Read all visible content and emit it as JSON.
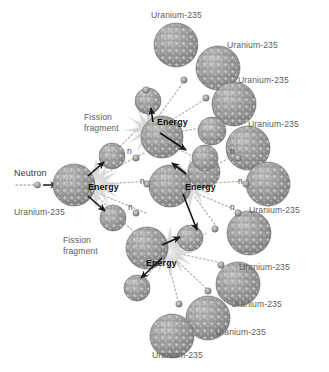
{
  "figure": {
    "type": "diagram",
    "background_color": "#ffffff",
    "nucleus_color": "#8d8d8d",
    "label_color": "#5d5d5d",
    "emphasis_color": "#111111"
  },
  "labels": {
    "neutron": "Neutron",
    "energy": "Energy",
    "fission_fragment": "Fission\nfragment",
    "uranium": "Uranium-235",
    "neutron_short": "n"
  },
  "annotations": [
    {
      "id": "neutron-in",
      "text": "Neutron",
      "x": 14,
      "y": 172,
      "style": "neu"
    },
    {
      "id": "uranium-left",
      "text": "Uranium-235",
      "x": 14,
      "y": 212,
      "style": "plain"
    },
    {
      "id": "fission-frag-1",
      "text": "Fission",
      "x": 84,
      "y": 116,
      "style": "plain"
    },
    {
      "id": "fission-frag-1b",
      "text": "fragment",
      "x": 84,
      "y": 127,
      "style": "plain"
    },
    {
      "id": "fission-frag-2",
      "text": "Fission",
      "x": 63,
      "y": 239,
      "style": "plain"
    },
    {
      "id": "fission-frag-2b",
      "text": "fragment",
      "x": 63,
      "y": 250,
      "style": "plain"
    },
    {
      "id": "energy-top",
      "text": "Energy",
      "x": 157,
      "y": 121,
      "style": "dark"
    },
    {
      "id": "energy-mid-left",
      "text": "Energy",
      "x": 88,
      "y": 186,
      "style": "dark"
    },
    {
      "id": "energy-mid-right",
      "text": "Energy",
      "x": 185,
      "y": 186,
      "style": "dark"
    },
    {
      "id": "energy-bottom",
      "text": "Energy",
      "x": 146,
      "y": 262,
      "style": "dark"
    },
    {
      "id": "uranium-top-1",
      "text": "Uranium-235",
      "x": 151,
      "y": 14,
      "style": "plain"
    },
    {
      "id": "uranium-top-2",
      "text": "Uranium-235",
      "x": 227,
      "y": 44,
      "style": "plain"
    },
    {
      "id": "uranium-top-3",
      "text": "Uranium-235",
      "x": 238,
      "y": 79,
      "style": "plain"
    },
    {
      "id": "uranium-top-4",
      "text": "Uranium-235",
      "x": 248,
      "y": 123,
      "style": "plain"
    },
    {
      "id": "uranium-right-1",
      "text": "Uranium-235",
      "x": 249,
      "y": 209,
      "style": "plain"
    },
    {
      "id": "uranium-right-2",
      "text": "Uranium-235",
      "x": 239,
      "y": 266,
      "style": "plain"
    },
    {
      "id": "uranium-right-3",
      "text": "Uranium-235",
      "x": 231,
      "y": 303,
      "style": "plain"
    },
    {
      "id": "uranium-bot-1",
      "text": "Uranium-235",
      "x": 215,
      "y": 331,
      "style": "plain"
    },
    {
      "id": "uranium-bot-2",
      "text": "Uranium-235",
      "x": 152,
      "y": 354,
      "style": "plain"
    },
    {
      "id": "n-1",
      "text": "n",
      "x": 127,
      "y": 150,
      "style": "nlet"
    },
    {
      "id": "n-2",
      "text": "n",
      "x": 140,
      "y": 180,
      "style": "nlet"
    },
    {
      "id": "n-3",
      "text": "n",
      "x": 128,
      "y": 206,
      "style": "nlet"
    },
    {
      "id": "n-4",
      "text": "n",
      "x": 230,
      "y": 150,
      "style": "nlet"
    },
    {
      "id": "n-5",
      "text": "n",
      "x": 238,
      "y": 180,
      "style": "nlet"
    },
    {
      "id": "n-6",
      "text": "n",
      "x": 230,
      "y": 206,
      "style": "nlet"
    }
  ],
  "nuclei": [
    {
      "id": "u-target-1",
      "role": "target",
      "cx": 74,
      "cy": 185,
      "r": 21
    },
    {
      "id": "u-target-2",
      "role": "target",
      "cx": 162,
      "cy": 137,
      "r": 21
    },
    {
      "id": "u-target-3",
      "role": "target",
      "cx": 170,
      "cy": 186,
      "r": 21
    },
    {
      "id": "u-target-4",
      "role": "target",
      "cx": 147,
      "cy": 248,
      "r": 21
    },
    {
      "id": "frag-1",
      "role": "fragment",
      "cx": 112,
      "cy": 156,
      "r": 13
    },
    {
      "id": "frag-2",
      "role": "fragment",
      "cx": 113,
      "cy": 218,
      "r": 13
    },
    {
      "id": "frag-3",
      "role": "fragment",
      "cx": 148,
      "cy": 101,
      "r": 13
    },
    {
      "id": "frag-4",
      "role": "fragment",
      "cx": 205,
      "cy": 158,
      "r": 13
    },
    {
      "id": "frag-5",
      "role": "fragment",
      "cx": 190,
      "cy": 238,
      "r": 13
    },
    {
      "id": "frag-6",
      "role": "fragment",
      "cx": 137,
      "cy": 288,
      "r": 13
    },
    {
      "id": "u-free-1",
      "role": "free",
      "cx": 176,
      "cy": 45,
      "r": 22
    },
    {
      "id": "u-free-2",
      "role": "free",
      "cx": 218,
      "cy": 68,
      "r": 22
    },
    {
      "id": "u-free-3",
      "role": "free",
      "cx": 234,
      "cy": 104,
      "r": 22
    },
    {
      "id": "u-free-4",
      "role": "free",
      "cx": 212,
      "cy": 131,
      "r": 14
    },
    {
      "id": "u-free-5",
      "role": "free",
      "cx": 248,
      "cy": 148,
      "r": 22
    },
    {
      "id": "u-free-6",
      "role": "free",
      "cx": 204,
      "cy": 172,
      "r": 16
    },
    {
      "id": "u-free-7",
      "role": "free",
      "cx": 268,
      "cy": 184,
      "r": 22
    },
    {
      "id": "u-free-8",
      "role": "free",
      "cx": 249,
      "cy": 233,
      "r": 22
    },
    {
      "id": "u-free-9",
      "role": "free",
      "cx": 238,
      "cy": 284,
      "r": 22
    },
    {
      "id": "u-free-10",
      "role": "free",
      "cx": 208,
      "cy": 318,
      "r": 22
    },
    {
      "id": "u-free-11",
      "role": "free",
      "cx": 172,
      "cy": 336,
      "r": 22
    }
  ],
  "bursts": [
    {
      "id": "burst-1",
      "cx": 96,
      "cy": 184,
      "r": 26
    },
    {
      "id": "burst-2",
      "cx": 150,
      "cy": 130,
      "r": 26
    },
    {
      "id": "burst-3",
      "cx": 190,
      "cy": 183,
      "r": 26
    },
    {
      "id": "burst-4",
      "cx": 170,
      "cy": 252,
      "r": 26
    }
  ],
  "incoming_neutron": {
    "id": "neutron-incoming",
    "trail_from_x": 16,
    "trail_to_x": 38,
    "y": 185,
    "arrow_from_x": 42,
    "arrow_to_x": 56
  }
}
